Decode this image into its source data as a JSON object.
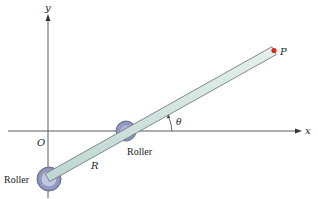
{
  "diagram": {
    "axes": {
      "x_label": "x",
      "y_label": "y",
      "origin_label": "O"
    },
    "bar": {
      "end_label": "P",
      "length_label": "R",
      "angle_label": "θ"
    },
    "rollers": [
      {
        "label": "Roller",
        "position": "bottom-left"
      },
      {
        "label": "Roller",
        "position": "on-x-axis"
      }
    ],
    "colors": {
      "axis": "#5a5a5a",
      "bar_fill": "#cfe3df",
      "bar_edge": "#6f7f7d",
      "roller_outer": "#8d93b8",
      "roller_inner": "#c9cde6",
      "tip": "#d9281e",
      "text": "#222222"
    }
  }
}
